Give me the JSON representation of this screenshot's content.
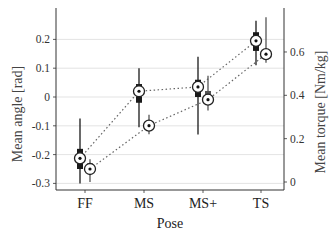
{
  "chart_data": {
    "type": "box",
    "title": "",
    "xlabel": "Pose",
    "ylabel_left": "Mean angle [rad]",
    "ylabel_right": "Mean torque [Nm/kg]",
    "categories": [
      "FF",
      "MS",
      "MS+",
      "TS"
    ],
    "yticks_left": [
      "0.2",
      "0.1",
      "0",
      "-0.1",
      "-0.2",
      "-0.3"
    ],
    "yticks_right": [
      "0.6",
      "0.4",
      "0.2",
      "0"
    ],
    "ylim_left": [
      -0.31,
      0.3
    ],
    "ylim_right": [
      -0.02,
      0.78
    ],
    "grid": true,
    "series": [
      {
        "name": "Mean angle",
        "axis": "left",
        "color": "#1a1a1a",
        "median": [
          -0.213,
          0.02,
          0.035,
          0.195
        ],
        "q1": [
          -0.25,
          -0.02,
          0.0,
          0.16
        ],
        "q3": [
          -0.18,
          0.045,
          0.06,
          0.225
        ],
        "whisker_low": [
          -0.3,
          -0.105,
          -0.13,
          0.11
        ],
        "whisker_high": [
          -0.075,
          0.1,
          0.14,
          0.265
        ]
      },
      {
        "name": "Mean torque",
        "axis": "right",
        "color": "#555555",
        "median": [
          0.06,
          0.26,
          0.38,
          0.59
        ],
        "q1": [
          0.04,
          0.25,
          0.36,
          0.57
        ],
        "q3": [
          0.085,
          0.27,
          0.42,
          0.61
        ],
        "whisker_low": [
          0.0,
          0.22,
          0.33,
          0.55
        ],
        "whisker_high": [
          0.105,
          0.31,
          0.49,
          0.76
        ]
      }
    ]
  }
}
